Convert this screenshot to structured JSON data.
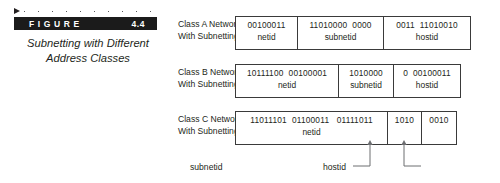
{
  "figure": {
    "label_word": "FIGURE",
    "number": "4.4",
    "caption_line1": "Subnetting with Different",
    "caption_line2": "Address Classes"
  },
  "diagram": {
    "rows": [
      {
        "label_line1": "Class A Network",
        "label_line2": "With Subnetting",
        "cells": [
          {
            "bits": "00100011",
            "tag": "netid",
            "width": 62
          },
          {
            "bits": "11010000  0000",
            "tag": "subnetid",
            "width": 86
          },
          {
            "bits": "0011  11010010",
            "tag": "hostid",
            "width": 86
          }
        ]
      },
      {
        "label_line1": "Class B Network",
        "label_line2": "With Subnetting",
        "cells": [
          {
            "bits": "10111100  00100001",
            "tag": "netid",
            "width": 103
          },
          {
            "bits": "1010000",
            "tag": "subnetid",
            "width": 55
          },
          {
            "bits": "0  00100011",
            "tag": "hostid",
            "width": 66
          }
        ]
      },
      {
        "label_line1": "Class C Network",
        "label_line2": "With Subnetting",
        "cells": [
          {
            "bits": "11011101  01100011   01111011",
            "tag": "netid",
            "width": 152
          },
          {
            "bits": "1010",
            "tag": "",
            "width": 34
          },
          {
            "bits": "0010",
            "tag": "",
            "width": 34
          }
        ]
      }
    ],
    "callouts": {
      "subnetid_label": "subnetid",
      "hostid_label": "hostid"
    }
  },
  "colors": {
    "bar_background": "#1b1b1b",
    "bar_text": "#ffffff",
    "ink": "#231f20",
    "rule": "#3a3a3a"
  }
}
